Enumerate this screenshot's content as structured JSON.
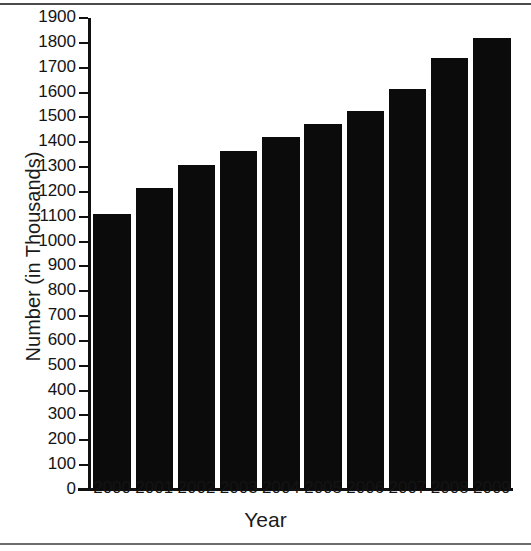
{
  "chart_data": {
    "type": "bar",
    "title": "",
    "xlabel": "Year",
    "ylabel": "Number (in Thousands)",
    "categories": [
      "2000",
      "2001",
      "2002",
      "2003",
      "2004",
      "2005",
      "2006",
      "2007",
      "2008",
      "2009"
    ],
    "values": [
      1110,
      1215,
      1310,
      1365,
      1420,
      1475,
      1525,
      1615,
      1740,
      1820
    ],
    "ylim": [
      0,
      1900
    ],
    "ytick_values": [
      0,
      100,
      200,
      300,
      400,
      500,
      600,
      700,
      800,
      900,
      1000,
      1100,
      1200,
      1300,
      1400,
      1500,
      1600,
      1700,
      1800,
      1900
    ],
    "ytick_labels": [
      "0",
      "100",
      "200",
      "300",
      "400",
      "500",
      "600",
      "700",
      "800",
      "900",
      "1000",
      "1100",
      "1200",
      "1300",
      "1400",
      "1500",
      "1600",
      "1700",
      "1800",
      "1900"
    ],
    "grid": false,
    "legend": null,
    "legend_position": "none",
    "bar_color": "#0b0b0b",
    "axis_color": "#111111",
    "text_color": "#141414",
    "background_color": "#ffffff"
  }
}
